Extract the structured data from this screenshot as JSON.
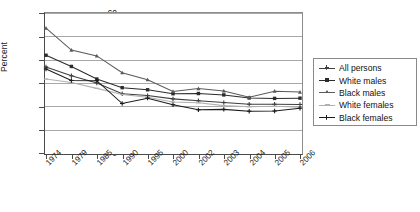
{
  "chart_data": {
    "type": "line",
    "title": "",
    "subtitle": "",
    "xlabel": "",
    "ylabel": "Percent",
    "categories": [
      "1974",
      "1979",
      "1985",
      "1990",
      "1995",
      "2000",
      "2002",
      "2003",
      "2004",
      "2005",
      "2006"
    ],
    "ylim": [
      0,
      60
    ],
    "ytick_labels": [
      "0",
      "10",
      "20",
      "30",
      "40",
      "50",
      "60"
    ],
    "ytick_values": [
      0,
      10,
      20,
      30,
      40,
      50,
      60
    ],
    "grid": true,
    "legend_position": "right",
    "series": [
      {
        "name": "All persons",
        "color": "#3f3f3f",
        "marker": "plus",
        "values": [
          36.9,
          33.1,
          30.0,
          25.4,
          24.6,
          23.2,
          22.4,
          21.6,
          20.9,
          20.9,
          20.8
        ]
      },
      {
        "name": "White males",
        "color": "#2b2b2b",
        "marker": "square",
        "values": [
          41.9,
          37.1,
          31.7,
          28.0,
          27.1,
          25.4,
          25.5,
          24.9,
          23.6,
          23.4,
          23.5
        ]
      },
      {
        "name": "Black males",
        "color": "#5a5a5a",
        "marker": "triangle",
        "values": [
          53.5,
          44.1,
          41.6,
          34.4,
          31.4,
          26.4,
          27.6,
          26.6,
          23.9,
          26.5,
          26.1
        ]
      },
      {
        "name": "White females",
        "color": "#b0b0b0",
        "marker": "dash",
        "values": [
          31.7,
          30.2,
          27.7,
          25.1,
          23.9,
          21.9,
          21.5,
          20.3,
          19.8,
          20.0,
          19.6
        ]
      },
      {
        "name": "Black females",
        "color": "#1a1a1a",
        "marker": "cross",
        "values": [
          36.0,
          31.1,
          31.0,
          21.2,
          23.5,
          20.7,
          18.5,
          18.7,
          17.9,
          18.0,
          19.2
        ]
      }
    ]
  },
  "legend": {
    "items": [
      {
        "label": "All persons"
      },
      {
        "label": "White males"
      },
      {
        "label": "Black males"
      },
      {
        "label": "White females"
      },
      {
        "label": "Black females"
      }
    ]
  },
  "axis": {
    "y_label": "Percent",
    "y_ticks": [
      "60",
      "50",
      "40",
      "30",
      "20",
      "10",
      "0"
    ],
    "x_ticks": [
      "1974",
      "1979",
      "1985",
      "1990",
      "1995",
      "2000",
      "2002",
      "2003",
      "2004",
      "2005",
      "2006"
    ]
  }
}
